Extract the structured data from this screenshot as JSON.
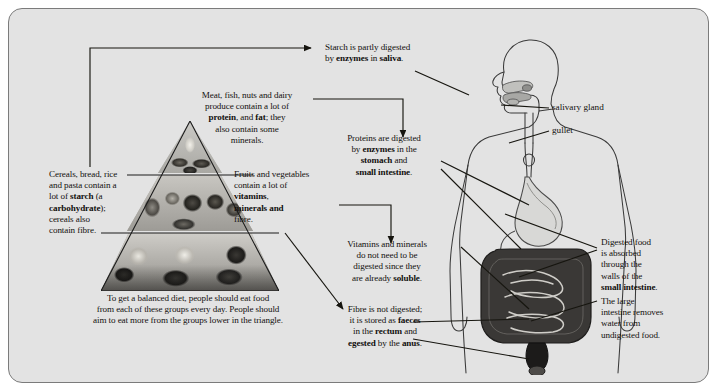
{
  "figure": {
    "background_color": "#e3e3e3",
    "border_color": "#7b7b7b"
  },
  "pyramid": {
    "name": "food-pyramid",
    "tiers": [
      {
        "id": "top",
        "label": "meat-fish-nuts-dairy-tier"
      },
      {
        "id": "middle",
        "label": "fruits-and-vegetables-tier"
      },
      {
        "id": "bottom",
        "label": "cereals-bread-rice-pasta-tier"
      }
    ]
  },
  "captions": {
    "starch": {
      "name": "starch-caption",
      "lines": [
        {
          "text": "Starch is partly digested"
        },
        {
          "text": "by ",
          "b1": "enzymes",
          "mid": " in ",
          "b2": "saliva",
          "end": "."
        }
      ],
      "plain": "Starch is partly digested\nby enzymes in saliva."
    },
    "meat": {
      "name": "meat-fish-nuts-dairy-caption",
      "plain": "Meat, fish, nuts and dairy\nproduce contain a lot of\nprotein, and fat; they\nalso contain some\nminerals."
    },
    "cereals": {
      "name": "cereals-caption",
      "plain": "Cereals, bread, rice\nand pasta contain a\nlot of starch (a\ncarbohydrate);\ncereals also\ncontain fibre."
    },
    "fruits": {
      "name": "fruits-vegetables-caption",
      "plain": "Fruits and vegetables\ncontain a lot of\nvitamins,\nminerals and\nfibre."
    },
    "balanced": {
      "name": "balanced-diet-caption",
      "plain": "To get a balanced diet, people should eat food\nfrom each of these groups every day. People should\naim to eat more from the groups lower in the triangle."
    },
    "proteins": {
      "name": "proteins-digested-caption",
      "plain": "Proteins are digested\nby enzymes in the\nstomach and\nsmall intestine."
    },
    "vitamins": {
      "name": "vitamins-minerals-soluble-caption",
      "plain": "Vitamins and minerals\ndo not need to be\ndigested since they\nare already soluble."
    },
    "fibre": {
      "name": "fibre-not-digested-caption",
      "plain": "Fibre is not digested;\nit is stored as faeces\nin the rectum and\negested by the anus."
    },
    "absorbed": {
      "name": "digested-food-absorbed-caption",
      "plain": "Digested food\nis absorbed\nthrough the\nwalls of the\nsmall intestine."
    },
    "large_intestine": {
      "name": "large-intestine-caption",
      "plain": "The large\nintestine removes\nwater from\nundigested food."
    }
  },
  "organ_labels": [
    {
      "name": "salivary-gland-label",
      "text": "salivary gland"
    },
    {
      "name": "gullet-label",
      "text": "gullet"
    }
  ]
}
